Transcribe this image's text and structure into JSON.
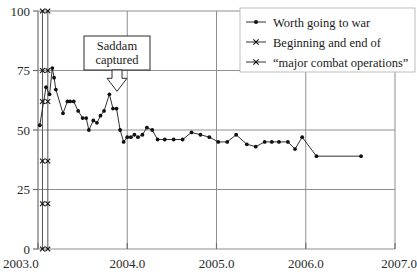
{
  "chart_data": {
    "type": "line",
    "title": "",
    "xlabel": "",
    "ylabel": "",
    "xlim": [
      2003.0,
      2007.0
    ],
    "ylim": [
      0,
      100
    ],
    "xticks": [
      "2003.0",
      "2004.0",
      "2005.0",
      "2006.0",
      "2007.0"
    ],
    "xtick_values": [
      2003.0,
      2004.0,
      2005.0,
      2006.0,
      2007.0
    ],
    "yticks": [
      "0",
      "25",
      "50",
      "75",
      "100"
    ],
    "ytick_values": [
      0,
      25,
      50,
      75,
      100
    ],
    "grid": true,
    "legend_position": "top-right",
    "series": [
      {
        "name": "Worth going to war",
        "marker": "filled-circle",
        "points": [
          [
            2003.02,
            52
          ],
          [
            2003.09,
            68
          ],
          [
            2003.13,
            65
          ],
          [
            2003.16,
            76
          ],
          [
            2003.18,
            72
          ],
          [
            2003.2,
            67
          ],
          [
            2003.28,
            57
          ],
          [
            2003.33,
            62
          ],
          [
            2003.36,
            62
          ],
          [
            2003.4,
            62
          ],
          [
            2003.45,
            58
          ],
          [
            2003.5,
            55
          ],
          [
            2003.54,
            55
          ],
          [
            2003.57,
            50
          ],
          [
            2003.62,
            54
          ],
          [
            2003.66,
            53
          ],
          [
            2003.7,
            56
          ],
          [
            2003.74,
            58
          ],
          [
            2003.8,
            65
          ],
          [
            2003.84,
            59
          ],
          [
            2003.88,
            59
          ],
          [
            2003.92,
            50
          ],
          [
            2003.96,
            45
          ],
          [
            2004.0,
            47
          ],
          [
            2004.04,
            47
          ],
          [
            2004.08,
            48
          ],
          [
            2004.12,
            47
          ],
          [
            2004.17,
            48
          ],
          [
            2004.22,
            51
          ],
          [
            2004.28,
            50
          ],
          [
            2004.34,
            46
          ],
          [
            2004.42,
            46
          ],
          [
            2004.52,
            46
          ],
          [
            2004.62,
            46
          ],
          [
            2004.72,
            49
          ],
          [
            2004.82,
            48
          ],
          [
            2004.92,
            47
          ],
          [
            2005.02,
            45
          ],
          [
            2005.12,
            45
          ],
          [
            2005.22,
            48
          ],
          [
            2005.34,
            44
          ],
          [
            2005.44,
            43
          ],
          [
            2005.54,
            45
          ],
          [
            2005.62,
            45
          ],
          [
            2005.7,
            45
          ],
          [
            2005.8,
            45
          ],
          [
            2005.88,
            42
          ],
          [
            2005.96,
            47
          ],
          [
            2006.12,
            39
          ],
          [
            2006.62,
            39
          ]
        ]
      },
      {
        "name": "Beginning and end of",
        "marker": "x-cross",
        "points": [
          [
            2003.05,
            100
          ],
          [
            2003.05,
            75
          ],
          [
            2003.05,
            62
          ],
          [
            2003.05,
            37
          ],
          [
            2003.05,
            19
          ],
          [
            2003.05,
            0
          ]
        ]
      },
      {
        "name": "“major combat operations”",
        "marker": "x-cross",
        "points": [
          [
            2003.11,
            100
          ],
          [
            2003.11,
            75
          ],
          [
            2003.11,
            62
          ],
          [
            2003.11,
            37
          ],
          [
            2003.11,
            19
          ],
          [
            2003.11,
            0
          ]
        ]
      }
    ],
    "event_lines": [
      {
        "name": "beginning-of-major-combat-operations",
        "x": 2003.05
      },
      {
        "name": "end-of-major-combat-operations",
        "x": 2003.11
      }
    ],
    "annotations": [
      {
        "name": "saddam-captured",
        "line1": "Saddam",
        "line2": "captured",
        "x": 2003.8,
        "y": 65
      }
    ]
  },
  "legend": {
    "entries": [
      {
        "label": "Worth going to war",
        "marker": "filled-circle"
      },
      {
        "label": "Beginning and end of",
        "marker": "x-cross"
      },
      {
        "label": "“major combat operations”",
        "marker": "x-cross"
      }
    ]
  },
  "colors": {
    "line": "#1a1a1a",
    "marker": "#111111",
    "grid": "#8f8f8f",
    "axis": "#6f6f6f",
    "event_line": "#555555",
    "text": "#1a1a1a",
    "background": "#ffffff"
  }
}
